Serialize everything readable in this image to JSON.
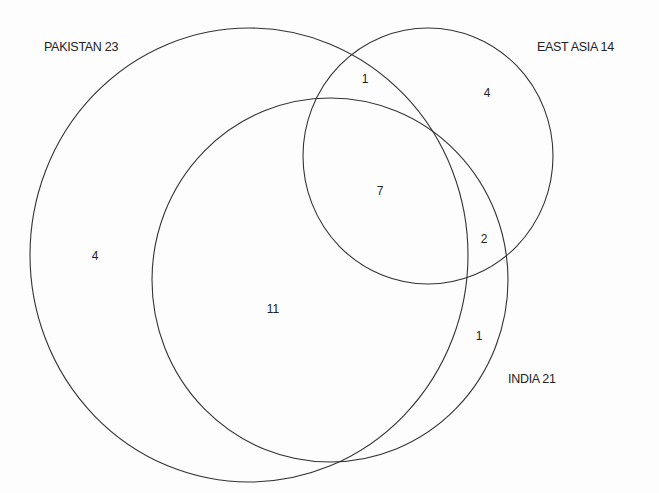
{
  "diagram": {
    "type": "venn",
    "sets": [
      {
        "id": "pakistan",
        "label": "PAKISTAN 23",
        "name": "PAKISTAN",
        "total": 23
      },
      {
        "id": "east_asia",
        "label": "EAST ASIA 14",
        "name": "EAST ASIA",
        "total": 14
      },
      {
        "id": "india",
        "label": "INDIA 21",
        "name": "INDIA",
        "total": 21
      }
    ],
    "regions": {
      "pakistan_only": "4",
      "pakistan_east_asia_only": "1",
      "east_asia_only": "4",
      "all_three": "7",
      "east_asia_india_only": "2",
      "pakistan_india_only": "11",
      "india_only": "1"
    },
    "stroke_color": "#333333",
    "background": "#fdfdfd"
  }
}
